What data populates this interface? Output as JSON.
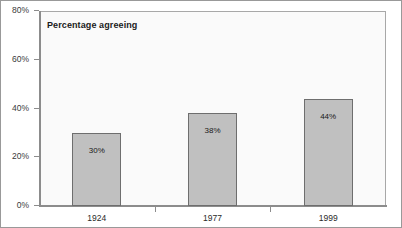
{
  "chart_data": {
    "type": "bar",
    "title": "Percentage agreeing",
    "xlabel": "",
    "ylabel": "",
    "categories": [
      "1924",
      "1977",
      "1999"
    ],
    "values": [
      30,
      38,
      44
    ],
    "value_labels": [
      "30%",
      "38%",
      "44%"
    ],
    "ylim": [
      0,
      80
    ],
    "ytick_values": [
      0,
      20,
      40,
      60,
      80
    ],
    "ytick_labels": [
      "0%",
      "20%",
      "40%",
      "60%",
      "80%"
    ],
    "grid": false,
    "legend": null,
    "series": [
      {
        "name": "Percentage agreeing",
        "values": [
          30,
          38,
          44
        ]
      }
    ],
    "colors": {
      "bar_fill": "#c0c0c0",
      "bar_border": "#6e6e6e",
      "plot_background": "#fafafa",
      "axis": "#8c8c8c",
      "figure_background": "#ffffff",
      "figure_border": "#999999",
      "text": "#1a1a1a"
    }
  }
}
